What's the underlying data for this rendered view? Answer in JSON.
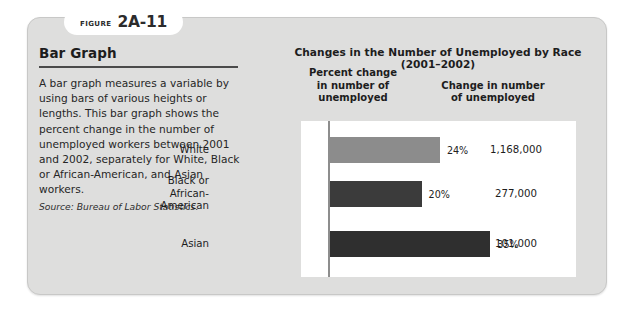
{
  "figure": {
    "badge_word": "FIGURE",
    "badge_number": "2A-11"
  },
  "panel": {
    "title": "Bar Graph",
    "body": "A bar graph measures a variable by using bars of various heights or lengths. This bar graph shows the percent change in the number of unemployed workers between 2001 and 2002, separately for White, Black or African-American, and Asian workers.",
    "source": "Source: Bureau of Labor Statistics."
  },
  "chart_data": {
    "type": "bar",
    "orientation": "horizontal",
    "title": "Changes in the Number of Unemployed by Race (2001–2002)",
    "column_headers": [
      "Percent change\nin number of\nunemployed",
      "Change in number\nof unemployed"
    ],
    "column_header_percent_l1": "Percent change",
    "column_header_percent_l2": "in number of",
    "column_header_percent_l3": "unemployed",
    "column_header_change_l1": "Change in number",
    "column_header_change_l2": "of unemployed",
    "categories": [
      "White",
      "Black or African-American",
      "Asian"
    ],
    "category_lines": [
      [
        "White"
      ],
      [
        "Black or",
        "African-",
        "American"
      ],
      [
        "Asian"
      ]
    ],
    "values": [
      24,
      20,
      35
    ],
    "value_labels": [
      "24%",
      "20%",
      "35%"
    ],
    "counts": [
      1168000,
      277000,
      101000
    ],
    "count_labels": [
      "1,168,000",
      "277,000",
      "101,000"
    ],
    "bar_colors": [
      "#8c8c8c",
      "#3b3b3b",
      "#2f2f2f"
    ],
    "xlabel": "",
    "ylabel": "",
    "xlim": [
      0,
      40
    ],
    "grid": false,
    "legend": "none"
  },
  "colors": {
    "card_background": "#dededd",
    "plot_background": "#ffffff",
    "axis": "#8d8d8d",
    "text": "#1d1d1d",
    "rule": "#4a4a4a"
  }
}
